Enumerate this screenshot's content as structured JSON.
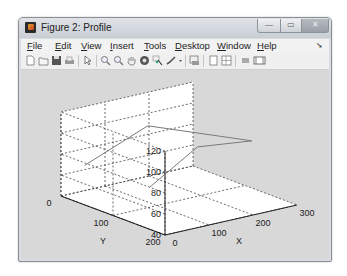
{
  "window": {
    "title": "Figure 2: Profile",
    "controls": {
      "minimize": "—",
      "maximize": "▭",
      "close": "✕"
    }
  },
  "menubar": {
    "items": [
      {
        "label": "File",
        "mnemonic": "F",
        "rest": "ile"
      },
      {
        "label": "Edit",
        "mnemonic": "E",
        "rest": "dit"
      },
      {
        "label": "View",
        "mnemonic": "V",
        "rest": "iew"
      },
      {
        "label": "Insert",
        "mnemonic": "I",
        "rest": "nsert"
      },
      {
        "label": "Tools",
        "mnemonic": "T",
        "rest": "ools"
      },
      {
        "label": "Desktop",
        "mnemonic": "D",
        "rest": "esktop"
      },
      {
        "label": "Window",
        "mnemonic": "W",
        "rest": "indow"
      },
      {
        "label": "Help",
        "mnemonic": "H",
        "rest": "elp"
      }
    ],
    "dock_arrow": "➘"
  },
  "toolbar": {
    "icons": [
      "new-figure-icon",
      "open-file-icon",
      "save-icon",
      "print-icon",
      "edit-plot-arrow-icon",
      "zoom-in-icon",
      "zoom-out-icon",
      "pan-hand-icon",
      "rotate-3d-icon",
      "data-cursor-icon",
      "brush-icon",
      "link-plot-icon",
      "colorbar-icon",
      "legend-icon",
      "hide-plot-tools-icon",
      "show-plot-tools-icon"
    ]
  },
  "chart_data": {
    "type": "line",
    "projection": "3d",
    "title": "",
    "xlabel": "X",
    "ylabel": "Y",
    "zlabel": "",
    "xlim": [
      0,
      300
    ],
    "ylim": [
      0,
      200
    ],
    "zlim": [
      40,
      120
    ],
    "x_ticks": [
      "0",
      "100",
      "200",
      "300"
    ],
    "y_ticks": [
      "0",
      "100",
      "200"
    ],
    "z_ticks": [
      "40",
      "60",
      "80",
      "100",
      "120"
    ],
    "grid": true,
    "grid_style": "dotted",
    "series": [
      {
        "name": "profile-upper",
        "points": [
          [
            30,
            20,
            70
          ],
          [
            150,
            40,
            100
          ],
          [
            280,
            130,
            90
          ]
        ]
      },
      {
        "name": "profile-lower",
        "points": [
          [
            60,
            120,
            65
          ],
          [
            180,
            110,
            90
          ],
          [
            280,
            130,
            90
          ]
        ]
      }
    ],
    "line_color": "#7a7a7a"
  }
}
